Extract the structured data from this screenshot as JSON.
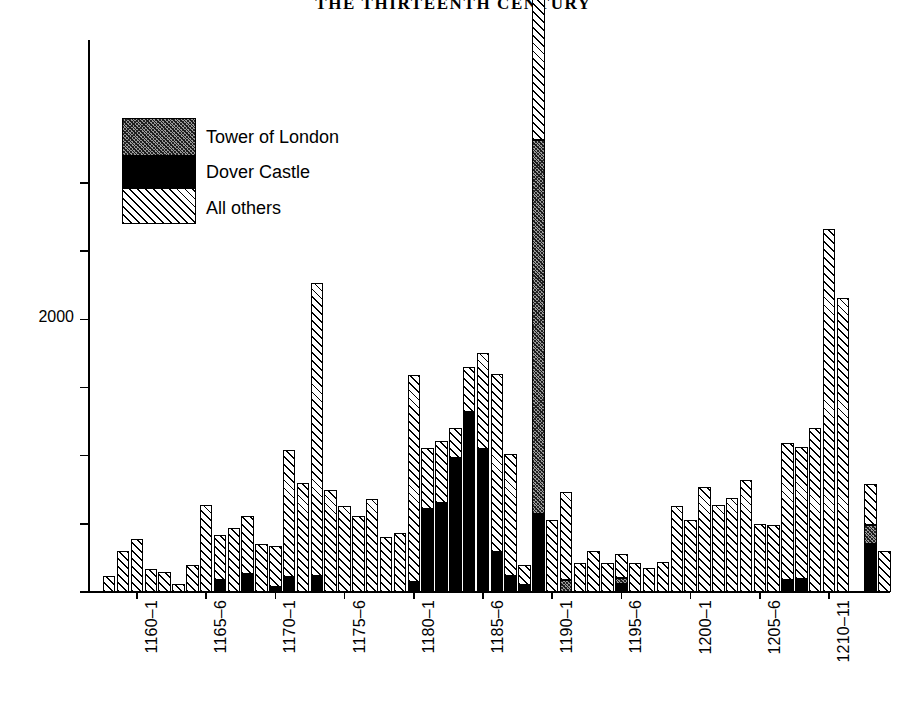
{
  "page": {
    "running_head": "THE THIRTEENTH CENTURY"
  },
  "legend": {
    "position": "inside-top-left",
    "items": [
      {
        "label": "Tower of London",
        "pattern": "dark-stipple",
        "color": "#555555"
      },
      {
        "label": "Dover Castle",
        "pattern": "solid-black",
        "color": "#000000"
      },
      {
        "label": "All others",
        "pattern": "diagonal-hatch",
        "color": "#ffffff"
      }
    ]
  },
  "axes": {
    "y_tick_labels": [
      "",
      "",
      "2000",
      "",
      "",
      "",
      ""
    ],
    "y_tick_values": [
      3000,
      2500,
      2000,
      1500,
      1000,
      500,
      0
    ],
    "x_tick_labels": [
      "1160–1",
      "1165–6",
      "1170–1",
      "1175–6",
      "1180–1",
      "1185–6",
      "1190–1",
      "1195–6",
      "1200–1",
      "1205–6",
      "1210–11"
    ]
  },
  "chart_data": {
    "type": "bar",
    "title": "THE THIRTEENTH CENTURY",
    "xlabel": "",
    "ylabel": "",
    "stacked": true,
    "grid": false,
    "legend_position": "inside-top-left",
    "ylim": [
      0,
      4050
    ],
    "y_ticks": [
      0,
      500,
      1000,
      1500,
      2000,
      2500,
      3000
    ],
    "y_tick_labels_shown": [
      "2000"
    ],
    "categories": [
      "1158–9",
      "1159–60",
      "1160–1",
      "1161–2",
      "1162–3",
      "1163–4",
      "1164–5",
      "1165–6",
      "1166–7",
      "1167–8",
      "1168–9",
      "1169–70",
      "1170–1",
      "1171–2",
      "1172–3",
      "1173–4",
      "1174–5",
      "1175–6",
      "1176–7",
      "1177–8",
      "1178–9",
      "1179–80",
      "1180–1",
      "1181–2",
      "1182–3",
      "1183–4",
      "1184–5",
      "1185–6",
      "1186–7",
      "1187–8",
      "1188–9",
      "1189–90",
      "1190–1",
      "1191–2",
      "1192–3",
      "1193–4",
      "1194–5",
      "1195–6",
      "1196–7",
      "1197–8",
      "1198–9",
      "1199–1200",
      "1200–1",
      "1201–2",
      "1202–3",
      "1203–4",
      "1204–5",
      "1205–6",
      "1206–7",
      "1207–8",
      "1208–9",
      "1209–10",
      "1210–11",
      "1211–12",
      "1212–13",
      "1213–14",
      "1214–15"
    ],
    "series": [
      {
        "name": "All others",
        "pattern": "diagonal-hatch",
        "values": [
          115,
          300,
          390,
          170,
          150,
          60,
          195,
          640,
          330,
          470,
          430,
          350,
          300,
          930,
          800,
          2150,
          750,
          630,
          555,
          680,
          400,
          430,
          1520,
          450,
          455,
          220,
          330,
          700,
          1310,
          890,
          150,
          3340,
          530,
          650,
          210,
          300,
          210,
          175,
          210,
          175,
          220,
          630,
          530,
          770,
          640,
          690,
          820,
          500,
          490,
          1010,
          970,
          1205,
          2660,
          2160,
          0,
          300,
          300
        ]
      },
      {
        "name": "Dover Castle",
        "pattern": "solid-black",
        "values": [
          0,
          0,
          0,
          0,
          0,
          0,
          0,
          0,
          90,
          0,
          130,
          0,
          40,
          110,
          0,
          120,
          0,
          0,
          0,
          0,
          0,
          0,
          75,
          610,
          650,
          980,
          1320,
          1050,
          290,
          120,
          50,
          570,
          0,
          0,
          0,
          0,
          0,
          60,
          0,
          0,
          0,
          0,
          0,
          0,
          0,
          0,
          0,
          0,
          0,
          85,
          95,
          0,
          0,
          0,
          0,
          355,
          0
        ]
      },
      {
        "name": "Tower of London",
        "pattern": "dark-stipple",
        "values": [
          0,
          0,
          0,
          0,
          0,
          0,
          0,
          0,
          0,
          0,
          0,
          0,
          0,
          0,
          0,
          0,
          0,
          0,
          0,
          0,
          0,
          0,
          0,
          0,
          0,
          0,
          0,
          0,
          0,
          0,
          0,
          2750,
          0,
          85,
          0,
          0,
          0,
          45,
          0,
          0,
          0,
          0,
          0,
          0,
          0,
          0,
          0,
          0,
          0,
          0,
          0,
          0,
          0,
          0,
          0,
          140,
          0
        ]
      }
    ]
  }
}
